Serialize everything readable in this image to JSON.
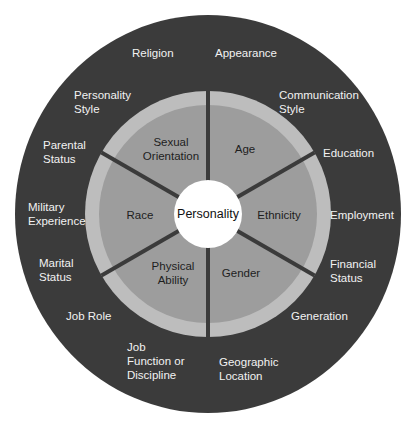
{
  "diagram": {
    "core": {
      "label": "Personality"
    },
    "inner_dimensions": [
      {
        "lines": [
          "Age"
        ]
      },
      {
        "lines": [
          "Ethnicity"
        ]
      },
      {
        "lines": [
          "Gender"
        ]
      },
      {
        "lines": [
          "Physical",
          "Ability"
        ]
      },
      {
        "lines": [
          "Race"
        ]
      },
      {
        "lines": [
          "Sexual",
          "Orientation"
        ]
      }
    ],
    "outer_dimensions": [
      {
        "lines": [
          "Appearance"
        ]
      },
      {
        "lines": [
          "Communication",
          "Style"
        ]
      },
      {
        "lines": [
          "Education"
        ]
      },
      {
        "lines": [
          "Employment"
        ]
      },
      {
        "lines": [
          "Financial",
          "Status"
        ]
      },
      {
        "lines": [
          "Generation"
        ]
      },
      {
        "lines": [
          "Geographic",
          "Location"
        ]
      },
      {
        "lines": [
          "Job",
          "Function or",
          "Discipline"
        ]
      },
      {
        "lines": [
          "Job Role"
        ]
      },
      {
        "lines": [
          "Marital",
          "Status"
        ]
      },
      {
        "lines": [
          "Military",
          "Experience"
        ]
      },
      {
        "lines": [
          "Parental",
          "Status"
        ]
      },
      {
        "lines": [
          "Personality",
          "Style"
        ]
      },
      {
        "lines": [
          "Religion"
        ]
      }
    ],
    "colors": {
      "outer_ring": "#3b3b3b",
      "light_ring": "#bdbdbd",
      "inner_segments": "#9d9d9d",
      "dividers": "#3b3b3b",
      "core": "#ffffff"
    }
  }
}
